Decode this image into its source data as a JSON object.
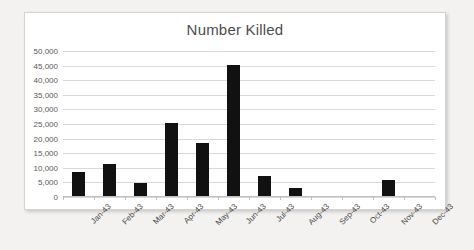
{
  "chart_data": {
    "type": "bar",
    "title": "Number Killed",
    "xlabel": "",
    "ylabel": "",
    "categories": [
      "Jan-43",
      "Feb-43",
      "Mar-43",
      "Apr-43",
      "May-43",
      "Jun-43",
      "Jul-43",
      "Aug-43",
      "Sep-43",
      "Oct-43",
      "Nov-43",
      "Dec-43"
    ],
    "values": [
      8300,
      11000,
      4500,
      25000,
      18200,
      45000,
      6800,
      2600,
      0,
      0,
      5400,
      0
    ],
    "ylim": [
      0,
      50000
    ],
    "ytick_labels": [
      "0",
      "5,000",
      "10,000",
      "15,000",
      "20,000",
      "25,000",
      "30,000",
      "35,000",
      "40,000",
      "45,000",
      "50,000"
    ],
    "ytick_values": [
      0,
      5000,
      10000,
      15000,
      20000,
      25000,
      30000,
      35000,
      40000,
      45000,
      50000
    ],
    "grid": true,
    "legend": false,
    "bar_color": "#111111",
    "gridline_color": "#d9d9d9",
    "title_color": "#4d4d4d",
    "plot_background": "#ffffff",
    "page_background": "#f3f2f0"
  }
}
